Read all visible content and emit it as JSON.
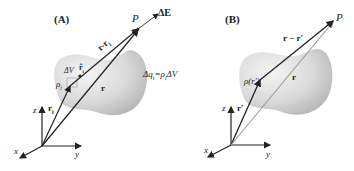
{
  "panels": [
    {
      "id": "A",
      "label": "(A)",
      "point_label": "P",
      "field_label": "ΔE",
      "vector_diff_label": "r-r",
      "vector_diff_sub": "i",
      "r_label": "r",
      "ri_label": "r",
      "ri_sub": "i",
      "volume_label": "ΔV",
      "rhat_label": "r̂",
      "rhat_sub": "i",
      "rho_label": "ρ",
      "rho_sub": "i",
      "charge_eq": "Δq",
      "charge_eq_sub": "i",
      "charge_eq_rhs": "=ρ",
      "charge_eq_rhs_sub": "i",
      "charge_eq_tail": "ΔV",
      "axes": {
        "x": "x",
        "y": "y",
        "z": "z"
      }
    },
    {
      "id": "B",
      "label": "(B)",
      "point_label": "P",
      "vector_diff_label": "r − r′",
      "r_label": "r",
      "rprime_label": "r′",
      "rho_label": "ρ(r′)",
      "axes": {
        "x": "x",
        "y": "y",
        "z": "z"
      }
    }
  ],
  "colors": {
    "arrow": "#222222",
    "blob_light": "#eeeeee",
    "blob_dark": "#bdbdbd",
    "r_vector_B": "#9a9a9a"
  }
}
